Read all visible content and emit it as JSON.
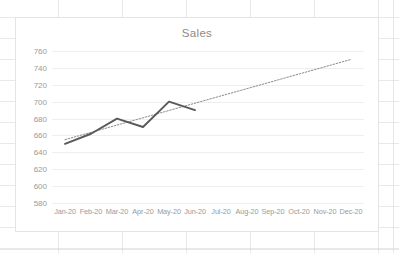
{
  "chart_data": {
    "type": "line",
    "title": "Sales",
    "xlabel": "",
    "ylabel": "",
    "categories": [
      "Jan-20",
      "Feb-20",
      "Mar-20",
      "Apr-20",
      "May-20",
      "Jun-20",
      "Jul-20",
      "Aug-20",
      "Sep-20",
      "Oct-20",
      "Nov-20",
      "Dec-20"
    ],
    "ylim": [
      580,
      760
    ],
    "ytick_labels": [
      "760",
      "740",
      "720",
      "700",
      "680",
      "660",
      "640",
      "620",
      "600",
      "580"
    ],
    "yticks": [
      760,
      740,
      720,
      700,
      680,
      660,
      640,
      620,
      600,
      580
    ],
    "grid": true,
    "legend": "none",
    "series": [
      {
        "name": "Sales",
        "style": "solid",
        "color": "#595959",
        "values": [
          650,
          662,
          680,
          670,
          700,
          690,
          null,
          null,
          null,
          null,
          null,
          null
        ]
      },
      {
        "name": "Linear (Sales)",
        "style": "dotted",
        "color": "#8c8c8c",
        "trendline": true,
        "start_value": 655,
        "end_value": 750
      }
    ]
  },
  "chart": {
    "title": "Sales"
  }
}
